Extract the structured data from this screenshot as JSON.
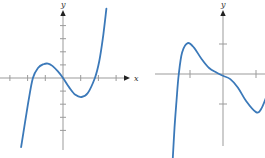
{
  "figure": {
    "background": "#ffffff",
    "curve_color": "#3b79b9",
    "axis_color": "#9b9b9b",
    "arrow_color": "#222222",
    "label_color": "#333333"
  },
  "chart_data": [
    {
      "type": "line",
      "title": "left panel: cubic-like curve through origin with local max at x≈-0.85 and local min at x≈1.05",
      "xlabel": "x",
      "ylabel": "y",
      "x_range": [
        -3.5,
        3.7
      ],
      "y_range": [
        -5.6,
        5.6
      ],
      "x_ticks": [
        -3,
        -2,
        -1,
        1,
        2,
        3
      ],
      "y_ticks": [
        -4,
        -3,
        -2,
        -1,
        1,
        2,
        3,
        4
      ],
      "grid": false,
      "legend": false,
      "key_points": {
        "x_intercepts": [
          -1.7,
          0,
          1.8
        ],
        "local_max": [
          -0.85,
          1.1
        ],
        "local_min": [
          1.05,
          -1.45
        ]
      },
      "samples": [
        [
          -2.37,
          -5.28
        ],
        [
          -2.15,
          -3.45
        ],
        [
          -1.95,
          -1.75
        ],
        [
          -1.7,
          0
        ],
        [
          -1.4,
          0.78
        ],
        [
          -1.1,
          1.05
        ],
        [
          -0.85,
          1.1
        ],
        [
          -0.6,
          0.92
        ],
        [
          -0.3,
          0.52
        ],
        [
          0,
          0
        ],
        [
          0.35,
          -0.72
        ],
        [
          0.7,
          -1.28
        ],
        [
          1.05,
          -1.45
        ],
        [
          1.4,
          -1.15
        ],
        [
          1.8,
          0
        ],
        [
          2.05,
          1.3
        ],
        [
          2.25,
          3.0
        ],
        [
          2.45,
          5.3
        ]
      ],
      "layout": {
        "origin_px": [
          63,
          78
        ],
        "x_tick_px": 17.7,
        "y_tick_px": 13.1,
        "x_axis_px": [
          0,
          125
        ],
        "y_axis_px": [
          15,
          150
        ],
        "tick_len": 6,
        "x_arrow": true,
        "y_arrow": true,
        "x_label_px": [
          134,
          81
        ],
        "y_label_px": [
          61,
          7
        ]
      }
    },
    {
      "type": "line",
      "title": "right panel: quintic-like curve with local max at x≈-1.1, horizontal-tangent inflection at origin, local min at x≈1 (clipped at right edge)",
      "xlabel": "",
      "ylabel": "y",
      "x_range": [
        -2.1,
        1.3
      ],
      "y_range": [
        -2.9,
        2.0
      ],
      "x_ticks": [
        -1,
        1
      ],
      "y_ticks": [
        -1,
        1
      ],
      "grid": false,
      "legend": false,
      "key_points": {
        "x_intercepts": [
          -1.34,
          0
        ],
        "local_max": [
          -1.07,
          1.03
        ],
        "local_min": [
          1.0,
          -1.27
        ],
        "inflection_flat": [
          0,
          0
        ]
      },
      "samples": [
        [
          -1.52,
          -2.8
        ],
        [
          -1.47,
          -1.8
        ],
        [
          -1.41,
          -0.9
        ],
        [
          -1.34,
          0
        ],
        [
          -1.24,
          0.72
        ],
        [
          -1.07,
          1.03
        ],
        [
          -0.88,
          0.88
        ],
        [
          -0.65,
          0.5
        ],
        [
          -0.42,
          0.2
        ],
        [
          -0.2,
          0.05
        ],
        [
          0,
          -0.06
        ],
        [
          0.22,
          -0.17
        ],
        [
          0.45,
          -0.45
        ],
        [
          0.7,
          -0.9
        ],
        [
          1.0,
          -1.27
        ],
        [
          1.15,
          -1.18
        ],
        [
          1.3,
          -0.8
        ]
      ],
      "layout": {
        "origin_px": [
          223,
          74
        ],
        "x_tick_px": 33,
        "y_tick_px": 30,
        "x_axis_px": [
          155,
          265.5
        ],
        "y_axis_px": [
          15,
          146
        ],
        "tick_len": 8,
        "x_arrow": false,
        "y_arrow": true,
        "x_label_px": [
          0,
          0
        ],
        "y_label_px": [
          221,
          7
        ]
      }
    }
  ]
}
